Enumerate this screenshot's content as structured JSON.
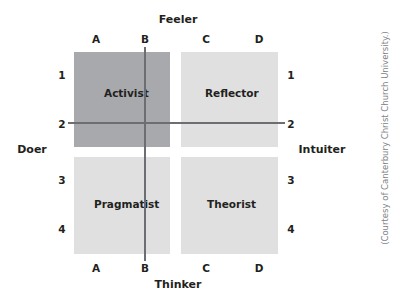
{
  "poles": {
    "top": "Feeler",
    "bottom": "Thinker",
    "left": "Doer",
    "right": "Intuiter"
  },
  "column_ticks": [
    "A",
    "B",
    "C",
    "D"
  ],
  "row_ticks": [
    "1",
    "2",
    "3",
    "4"
  ],
  "quadrants": [
    {
      "label": "Activist",
      "position": "top-left",
      "color": "#a7a9ac"
    },
    {
      "label": "Reflector",
      "position": "top-right",
      "color": "#e0e0e1"
    },
    {
      "label": "Pragmatist",
      "position": "bottom-left",
      "color": "#e0e0e1"
    },
    {
      "label": "Theorist",
      "position": "bottom-right",
      "color": "#e0e0e1"
    }
  ],
  "axis_lines": {
    "vertical_at": "B",
    "horizontal_at": "2",
    "color": "#6d6e71"
  },
  "credit": "(Courtesy of Canterbury Christ Church University.)"
}
